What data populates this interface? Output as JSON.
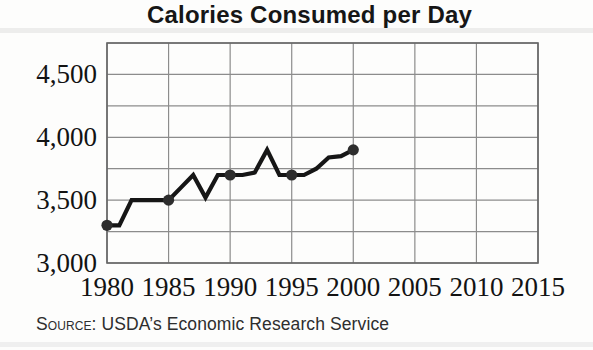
{
  "figure": {
    "title": "Calories Consumed per Day",
    "source_label": "Source:",
    "source_text": "USDA’s Economic Research Service"
  },
  "chart_data": {
    "type": "line",
    "title": "Calories Consumed per Day",
    "xlabel": "",
    "ylabel": "",
    "xlim": [
      1980,
      2015
    ],
    "ylim": [
      3000,
      4750
    ],
    "grid": {
      "visible": true,
      "x_step": 5,
      "y_step": 250
    },
    "x_ticks": [
      1980,
      1985,
      1990,
      1995,
      2000,
      2005,
      2010,
      2015
    ],
    "y_tick_labels": [
      {
        "value": 3000,
        "label": "3,000"
      },
      {
        "value": 3500,
        "label": "3,500"
      },
      {
        "value": 4000,
        "label": "4,000"
      },
      {
        "value": 4500,
        "label": "4,500"
      }
    ],
    "series": [
      {
        "name": "calories-consumed-per-day",
        "x": [
          1980,
          1981,
          1982,
          1983,
          1984,
          1985,
          1986,
          1987,
          1988,
          1989,
          1990,
          1991,
          1992,
          1993,
          1994,
          1995,
          1996,
          1997,
          1998,
          1999,
          2000
        ],
        "y": [
          3300,
          3300,
          3500,
          3500,
          3500,
          3500,
          3600,
          3700,
          3520,
          3700,
          3700,
          3700,
          3720,
          3900,
          3700,
          3700,
          3700,
          3750,
          3840,
          3850,
          3900
        ]
      }
    ],
    "markers": [
      {
        "x": 1980,
        "y": 3300
      },
      {
        "x": 1985,
        "y": 3500
      },
      {
        "x": 1990,
        "y": 3700
      },
      {
        "x": 1995,
        "y": 3700
      },
      {
        "x": 2000,
        "y": 3900
      }
    ],
    "source": "Source: USDA’s Economic Research Service",
    "legend": null,
    "colors": {
      "line": "#161616",
      "marker": "#2d2d2d",
      "grid": "#8c8c8c",
      "border": "#666666",
      "tick_text": "#131313"
    }
  }
}
